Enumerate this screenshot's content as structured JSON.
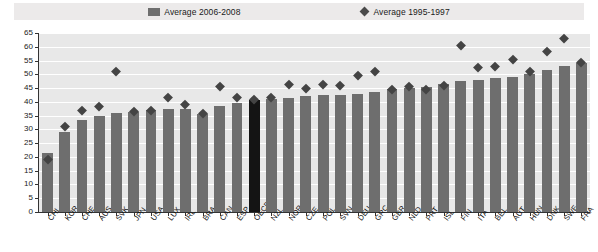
{
  "legend": {
    "series1": {
      "label": "Average 2006-2008",
      "marker": "bar-swatch",
      "color": "#6e6e6e"
    },
    "series2": {
      "label": "Average 1995-1997",
      "marker": "diamond-marker",
      "color": "#444444"
    }
  },
  "chart_data": {
    "type": "bar",
    "title": "",
    "subtitle": "",
    "xlabel": "",
    "ylabel": "",
    "ylim": [
      0,
      65
    ],
    "ytick_step": 5,
    "ytick_labels": [
      "0",
      "5",
      "10",
      "15",
      "20",
      "25",
      "30",
      "35",
      "40",
      "45",
      "50",
      "55",
      "60",
      "65"
    ],
    "grid": true,
    "legend_position": "top-center",
    "highlight_category": "OECD",
    "highlight_color": "#141414",
    "categories": [
      "CHL",
      "KOR",
      "CHE",
      "AUS",
      "SVK",
      "JPN",
      "USA",
      "LUX",
      "IRL",
      "BRA",
      "CAN",
      "ESP",
      "OECD",
      "NZL",
      "NOR",
      "CZE",
      "POL",
      "SVN",
      "DEU",
      "GRC",
      "GBR",
      "NLD",
      "PRT",
      "ISL",
      "FIN",
      "ITA",
      "BEL",
      "AUT",
      "HUN",
      "DNK",
      "SWE",
      "FRA"
    ],
    "series": [
      {
        "name": "Average 2006-2008",
        "type": "bar",
        "color": "#6e6e6e",
        "values": [
          21.5,
          29.0,
          33.5,
          35.0,
          36.0,
          36.5,
          37.0,
          37.5,
          37.5,
          35.5,
          38.5,
          39.5,
          40.5,
          41.0,
          41.5,
          42.0,
          42.5,
          42.5,
          43.0,
          43.5,
          44.5,
          45.0,
          45.5,
          46.5,
          47.5,
          48.0,
          48.5,
          49.0,
          50.0,
          51.5,
          53.0,
          54.0
        ]
      },
      {
        "name": "Average 1995-1997",
        "type": "scatter",
        "marker": "diamond",
        "color": "#444444",
        "values": [
          19.0,
          31.0,
          37.0,
          38.5,
          51.0,
          36.5,
          37.0,
          41.5,
          39.0,
          36.0,
          45.5,
          41.5,
          41.0,
          41.5,
          46.5,
          45.0,
          46.5,
          46.0,
          49.5,
          51.0,
          44.5,
          45.5,
          44.5,
          46.0,
          60.5,
          52.5,
          53.0,
          55.5,
          51.0,
          58.5,
          63.0,
          54.5
        ]
      }
    ]
  }
}
